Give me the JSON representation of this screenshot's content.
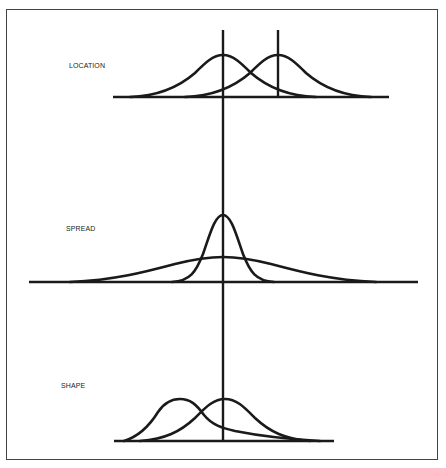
{
  "panels": [
    {
      "id": "location",
      "label": "LOCATION",
      "description": "Two normal curves of equal spread with shifted means"
    },
    {
      "id": "spread",
      "label": "SPREAD",
      "description": "Two normal curves with same mean, narrow vs wide spread"
    },
    {
      "id": "shape",
      "label": "SHAPE",
      "description": "Right-skewed curve vs symmetric normal curve"
    }
  ],
  "colors": {
    "line": "#1a1a1a",
    "frame": "#444444",
    "background": "#ffffff"
  }
}
